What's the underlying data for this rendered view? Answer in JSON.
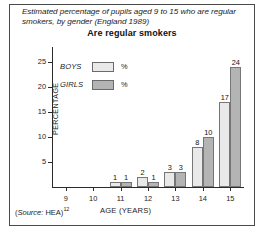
{
  "figure": {
    "caption": "Estimated percentage of pupils aged 9 to 15 who are regular smokers, by gender (England 1989)",
    "source_prefix": "(",
    "source_word": "Source:",
    "source_body": " HEA)",
    "source_superscript": "12"
  },
  "legend": {
    "items": [
      {
        "label": "BOYS",
        "unit": "%",
        "color": "#e9e9e9"
      },
      {
        "label": "GIRLS",
        "unit": "%",
        "color": "#b4b4b4"
      }
    ]
  },
  "chart_data": {
    "type": "bar",
    "title": "Are regular smokers",
    "xlabel": "AGE (YEARS)",
    "ylabel": "PERCENTAGE",
    "categories": [
      "9",
      "10",
      "11",
      "12",
      "13",
      "14",
      "15"
    ],
    "series": [
      {
        "name": "BOYS",
        "color": "#e9e9e9",
        "values": [
          0,
          0,
          1,
          2,
          3,
          8,
          17
        ]
      },
      {
        "name": "GIRLS",
        "color": "#b4b4b4",
        "values": [
          0,
          0,
          1,
          1,
          3,
          10,
          24
        ]
      }
    ],
    "value_labels": {
      "BOYS": [
        "",
        "",
        "1",
        "2",
        "3",
        "8",
        "17"
      ],
      "GIRLS": [
        "",
        "",
        "1",
        "1",
        "3",
        "10",
        "24"
      ]
    },
    "ylim": [
      0,
      28
    ],
    "yticks": [
      5,
      10,
      15,
      20,
      25
    ],
    "ytick_labels": [
      "5",
      "10",
      "15",
      "20",
      "25"
    ],
    "grid": false,
    "legend_position": "inside-top-left"
  }
}
